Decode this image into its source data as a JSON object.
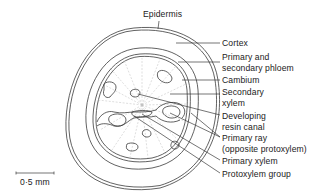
{
  "figure": {
    "type": "anatomical-diagram",
    "colors": {
      "line": "#3a3a3a",
      "faint": "#b8b8b8",
      "text": "#222222",
      "background": "#ffffff"
    }
  },
  "labels": {
    "epidermis": "Epidermis",
    "cortex": "Cortex",
    "phloem_line1": "Primary and",
    "phloem_line2": "secondary phloem",
    "cambium": "Cambium",
    "sec_xylem_line1": "Secondary",
    "sec_xylem_line2": "xylem",
    "resin_line1": "Developing",
    "resin_line2": "resin canal",
    "ray_line1": "Primary ray",
    "ray_line2": "(opposite protoxylem)",
    "primary_xylem": "Primary xylem",
    "protoxylem_group": "Protoxylem group"
  },
  "scale_bar": {
    "label": "0·5 mm"
  }
}
